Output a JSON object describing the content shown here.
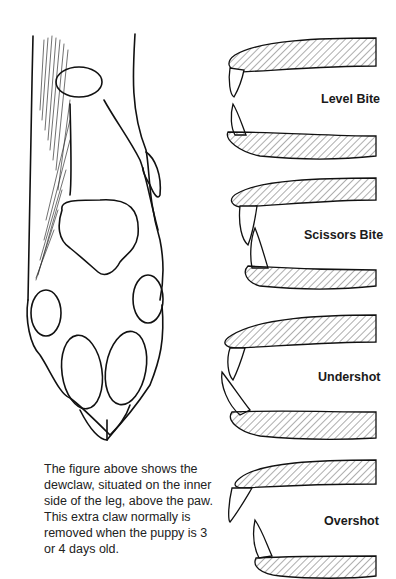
{
  "figure": {
    "paw_illustration": "dog paw with dewclaw",
    "caption": "The figure above shows the dewclaw, situated on the inner side of the leg, above the paw. This extra claw normally is removed when the puppy is 3 or 4 days old."
  },
  "bites": [
    {
      "label": "Level Bite"
    },
    {
      "label": "Scissors Bite"
    },
    {
      "label": "Undershot"
    },
    {
      "label": "Overshot"
    }
  ]
}
